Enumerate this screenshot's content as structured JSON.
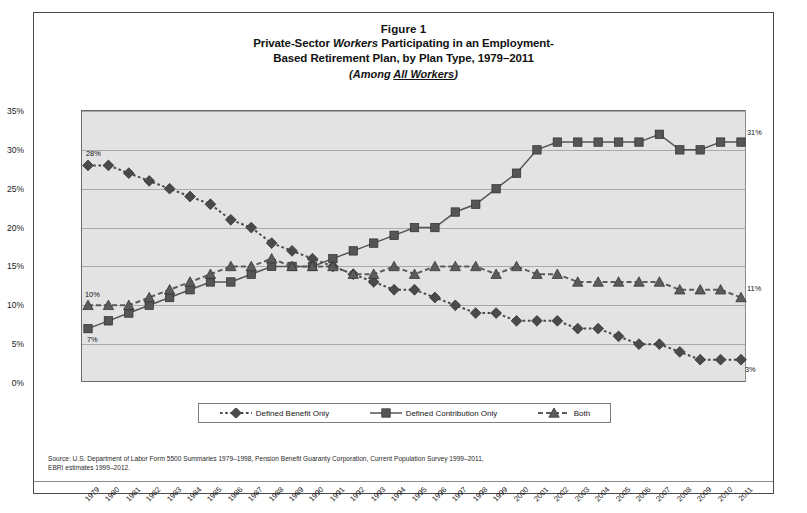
{
  "figure": {
    "number": "Figure 1",
    "title_part_1": "Private-Sector ",
    "title_italic": "Workers",
    "title_part_2": " Participating in an Employment-",
    "title_line_2": "Based Retirement Plan, by Plan Type, 1979–2011",
    "subtitle_lead": "(Among ",
    "subtitle_underlined": "All Workers",
    "subtitle_tail": ")"
  },
  "source": {
    "line_1": "Source: U.S. Department of Labor Form 5500 Summaries 1979–1998, Pension Benefit Guaranty Corporation, Current Population Survey 1999–2011,",
    "line_2": "EBRI estimates 1999–2012."
  },
  "legend": {
    "items": [
      {
        "label": "Defined Benefit Only",
        "marker": "diamond",
        "style": "dotted",
        "color": "#4a4a4a"
      },
      {
        "label": "Defined Contribution Only",
        "marker": "square",
        "style": "solid",
        "color": "#555555"
      },
      {
        "label": "Both",
        "marker": "triangle",
        "style": "dashed",
        "color": "#5c5c5c"
      }
    ]
  },
  "annotations": [
    {
      "name": "db-start-label",
      "text": "28%",
      "year": 1979,
      "value": 28,
      "dx": -2,
      "dy": -11
    },
    {
      "name": "both-start-label",
      "text": "10%",
      "year": 1979,
      "value": 10,
      "dx": -3,
      "dy": -10
    },
    {
      "name": "dc-start-label",
      "text": "7%",
      "year": 1979,
      "value": 7,
      "dx": -1,
      "dy": 11
    },
    {
      "name": "dc-end-label",
      "text": "31%",
      "year": 2011,
      "value": 31,
      "dx": 6,
      "dy": -9
    },
    {
      "name": "both-end-label",
      "text": "11%",
      "year": 2011,
      "value": 11,
      "dx": 6,
      "dy": -9
    },
    {
      "name": "db-end-label",
      "text": "3%",
      "year": 2011,
      "value": 3,
      "dx": 4,
      "dy": 10
    }
  ],
  "chart_data": {
    "type": "line",
    "xlabel": "",
    "ylabel": "",
    "ylim": [
      0,
      35
    ],
    "yticks": [
      "0%",
      "5%",
      "10%",
      "15%",
      "20%",
      "25%",
      "30%",
      "35%"
    ],
    "ytick_values": [
      0,
      5,
      10,
      15,
      20,
      25,
      30,
      35
    ],
    "grid": true,
    "legend_position": "bottom",
    "categories": [
      "1979",
      "1980",
      "1981",
      "1982",
      "1983",
      "1984",
      "1985",
      "1986",
      "1987",
      "1988",
      "1989",
      "1990",
      "1991",
      "1992",
      "1993",
      "1994",
      "1995",
      "1996",
      "1997",
      "1998",
      "1999",
      "2000",
      "2001",
      "2002",
      "2003",
      "2004",
      "2005",
      "2006",
      "2007",
      "2008",
      "2009",
      "2010",
      "2011"
    ],
    "series": [
      {
        "name": "Defined Benefit Only",
        "marker": "diamond",
        "values": [
          28,
          28,
          27,
          26,
          25,
          24,
          23,
          21,
          20,
          18,
          17,
          16,
          15,
          14,
          13,
          12,
          12,
          11,
          10,
          9,
          9,
          8,
          8,
          8,
          7,
          7,
          6,
          5,
          5,
          4,
          3,
          3,
          3
        ]
      },
      {
        "name": "Defined Contribution Only",
        "marker": "square",
        "values": [
          7,
          8,
          9,
          10,
          11,
          12,
          13,
          13,
          14,
          15,
          15,
          15,
          16,
          17,
          18,
          19,
          20,
          20,
          22,
          23,
          25,
          27,
          30,
          31,
          31,
          31,
          31,
          31,
          32,
          30,
          30,
          31,
          31
        ]
      },
      {
        "name": "Both",
        "marker": "triangle",
        "values": [
          10,
          10,
          10,
          11,
          12,
          13,
          14,
          15,
          15,
          16,
          15,
          15,
          15,
          14,
          14,
          15,
          14,
          15,
          15,
          15,
          14,
          15,
          14,
          14,
          13,
          13,
          13,
          13,
          13,
          12,
          12,
          12,
          11
        ]
      }
    ]
  }
}
